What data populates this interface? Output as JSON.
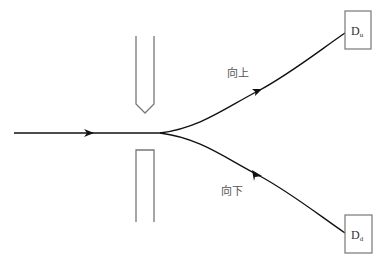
{
  "diagram": {
    "type": "particle-beam-deflection",
    "labels": {
      "upper_path": "向上",
      "lower_path": "向下"
    },
    "detectors": {
      "upper": {
        "main": "D",
        "sub": "u"
      },
      "lower": {
        "main": "D",
        "sub": "d"
      }
    },
    "colors": {
      "beam": "#111111",
      "plates": "#777777",
      "detector_box": "#777777",
      "text": "#555555"
    }
  }
}
